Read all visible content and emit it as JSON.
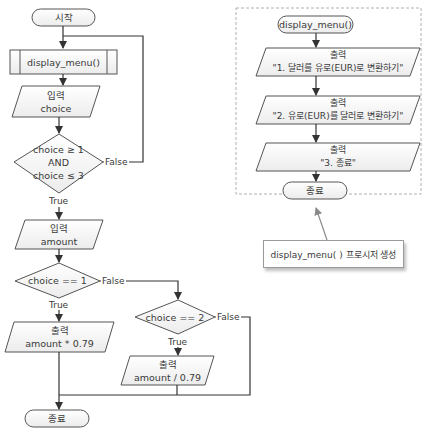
{
  "main_flow": {
    "start": "시작",
    "call_display_menu": "display_menu()",
    "input_choice": {
      "label": "입력",
      "var": "choice"
    },
    "decision_range": {
      "line1": "choice ≥ 1",
      "line2": "AND",
      "line3": "choice ≤ 3",
      "true_label": "True",
      "false_label": "False"
    },
    "input_amount": {
      "label": "입력",
      "var": "amount"
    },
    "decision_choice1": {
      "text": "choice == 1",
      "true_label": "True",
      "false_label": "False"
    },
    "decision_choice2": {
      "text": "choice == 2",
      "true_label": "True",
      "false_label": "False"
    },
    "output_mul": {
      "label": "출력",
      "expr": "amount * 0.79"
    },
    "output_div": {
      "label": "출력",
      "expr": "amount / 0.79"
    },
    "end": "종료"
  },
  "procedure": {
    "start": "display_menu()",
    "outputs": [
      {
        "label": "출력",
        "text": "\"1. 달러를 유로(EUR)로 변환하기\""
      },
      {
        "label": "출력",
        "text": "\"2. 유로(EUR)를 달러로 변환하기\""
      },
      {
        "label": "출력",
        "text": "\"3. 종료\""
      }
    ],
    "end": "종료"
  },
  "callout": {
    "text": "display_menu( ) 프로시저 생성"
  },
  "colors": {
    "stroke": "#4a4a4a",
    "fill": "#f4f4f4",
    "dashed_border": "#b0b0b0",
    "arrow": "#333333"
  }
}
